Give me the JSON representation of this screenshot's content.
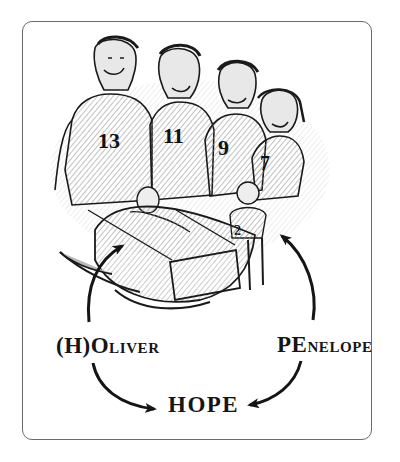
{
  "illustration": {
    "description": "Pencil sketch of a family: four children in numbered jerseys standing behind a cradle holding a baby, with a small child beside it",
    "jersey_numbers": [
      "13",
      "11",
      "9",
      "7",
      "2"
    ]
  },
  "labels": {
    "oliver": {
      "prefix": "(H)O",
      "rest": "LIVER"
    },
    "penelope": {
      "prefix": "PE",
      "rest": "NELOPE"
    },
    "hope": "HOPE"
  },
  "colors": {
    "ink": "#151515",
    "frame": "#6a6a6a",
    "shade": "#b8b8b8",
    "background": "#ffffff"
  }
}
